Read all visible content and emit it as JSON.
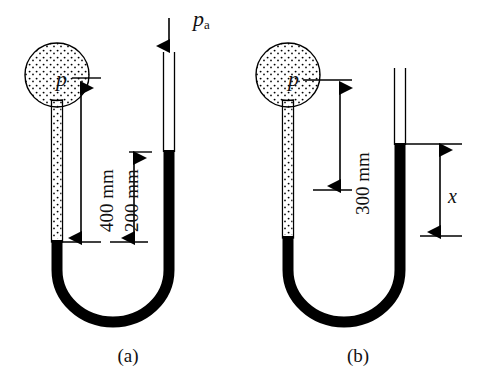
{
  "figure": {
    "type": "manometer-diagram",
    "panels": [
      {
        "id": "a",
        "caption": "(a)",
        "bulb_symbol": "p",
        "ambient_symbol": "p",
        "ambient_subscript": "a",
        "dimensions": [
          {
            "name": "bulb-to-mercury",
            "label": "400 mm",
            "value": 400,
            "unit": "mm"
          },
          {
            "name": "right-to-left-mercury",
            "label": "200 mm",
            "value": 200,
            "unit": "mm"
          }
        ]
      },
      {
        "id": "b",
        "caption": "(b)",
        "bulb_symbol": "p",
        "dimensions": [
          {
            "name": "bulb-to-mercury",
            "label": "300 mm",
            "value": 300,
            "unit": "mm"
          },
          {
            "name": "mercury-offset",
            "label": "x",
            "value": null,
            "unit": ""
          }
        ]
      }
    ],
    "colors": {
      "mercury": "#000000",
      "tube_outline": "#000000",
      "fluid_stipple": "#000000",
      "background": "#ffffff",
      "text": "#111111"
    }
  }
}
